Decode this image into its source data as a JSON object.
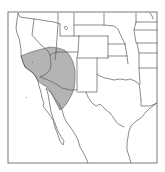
{
  "map": {
    "type": "species-range-map",
    "region": "Southwestern United States and northwestern Mexico",
    "colors": {
      "background": "#ffffff",
      "range_fill": "#b4b4b4",
      "boundary_stroke": "#5a5a5a",
      "frame_stroke": "#6a6a6a"
    },
    "layers": [
      {
        "name": "frame"
      },
      {
        "name": "state-boundaries"
      },
      {
        "name": "coastlines"
      },
      {
        "name": "shaded-range"
      }
    ],
    "shaded_range_covers": [
      "southern California",
      "southern Nevada",
      "western Arizona",
      "northeastern Baja California",
      "northwestern Sonora"
    ]
  }
}
